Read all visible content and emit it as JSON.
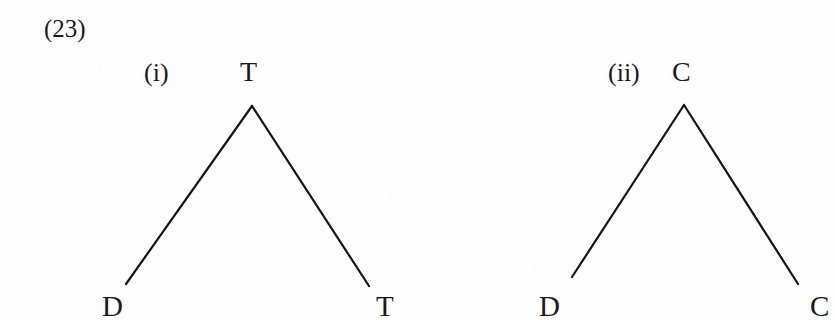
{
  "figure": {
    "example_number": "(23)",
    "domain_note": "syntax tree diagrams",
    "ink_color": "#141414",
    "paper_color": "#fefefe"
  },
  "trees": [
    {
      "item_number": "(i)",
      "root_label": "T",
      "left_leaf_label": "D",
      "right_leaf_label": "T",
      "apex": {
        "x": 252,
        "y": 106
      },
      "left_end": {
        "x": 126,
        "y": 284
      },
      "right_end": {
        "x": 369,
        "y": 286
      }
    },
    {
      "item_number": "(ii)",
      "root_label": "C",
      "left_leaf_label": "D",
      "right_leaf_label": "C",
      "apex": {
        "x": 684,
        "y": 105
      },
      "left_end": {
        "x": 572,
        "y": 277
      },
      "right_end": {
        "x": 798,
        "y": 284
      }
    }
  ],
  "positions": {
    "tree1_item_number": {
      "left": 144,
      "top": 60
    },
    "tree1_root": {
      "left": 240,
      "top": 58
    },
    "tree1_left_leaf": {
      "left": 102,
      "top": 292
    },
    "tree1_right_leaf": {
      "left": 376,
      "top": 292
    },
    "tree2_item_number": {
      "left": 608,
      "top": 60
    },
    "tree2_root": {
      "left": 672,
      "top": 58
    },
    "tree2_left_leaf": {
      "left": 539,
      "top": 292
    },
    "tree2_right_leaf": {
      "left": 810,
      "top": 292
    }
  }
}
